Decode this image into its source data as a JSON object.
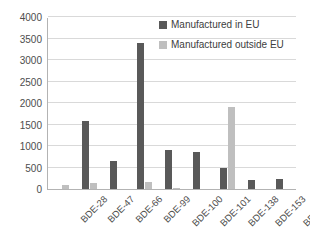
{
  "chart_data": {
    "type": "bar",
    "title": "",
    "subtitle": "",
    "xlabel": "",
    "ylabel": "",
    "categories": [
      "BDE-28",
      "BDE-47",
      "BDE-66",
      "BDE-99",
      "BDE-100",
      "BDE-101",
      "BDE-138",
      "BDE-153",
      "BDE-154"
    ],
    "series": [
      {
        "name": "Manufactured in EU",
        "color": "#595959",
        "values": [
          0,
          1590,
          650,
          3400,
          900,
          850,
          500,
          220,
          240
        ]
      },
      {
        "name": "Manufactured outside EU",
        "color": "#bfbfbf",
        "values": [
          90,
          130,
          0,
          170,
          30,
          0,
          1900,
          0,
          0
        ]
      }
    ],
    "ylim": [
      0,
      4000
    ],
    "yticks": [
      0,
      500,
      1000,
      1500,
      2000,
      2500,
      3000,
      3500,
      4000
    ],
    "ytick_labels": [
      "0",
      "500",
      "1000",
      "1500",
      "2000",
      "2500",
      "3000",
      "3500",
      "4000"
    ],
    "grid": true,
    "legend_position": "top-right",
    "xtick_rotation": -45
  },
  "legend": {
    "items": [
      {
        "label": "Manufactured in EU",
        "swatch": "#595959"
      },
      {
        "label": "Manufactured outside EU",
        "swatch": "#bfbfbf"
      }
    ]
  }
}
